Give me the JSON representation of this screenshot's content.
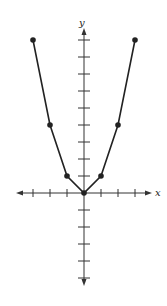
{
  "chart_data": {
    "type": "line",
    "title": "",
    "xlabel": "x",
    "ylabel": "y",
    "x": [
      -3,
      -2,
      -1,
      0,
      1,
      2,
      3
    ],
    "series": [
      {
        "name": "y = x^2",
        "values": [
          9,
          4,
          1,
          0,
          1,
          4,
          9
        ]
      }
    ],
    "xlim": [
      -4,
      4
    ],
    "ylim": [
      -5,
      9
    ],
    "x_ticks": [
      -3,
      -2,
      -1,
      1,
      2,
      3
    ],
    "y_ticks": [
      -5,
      -4,
      -3,
      -2,
      -1,
      1,
      2,
      3,
      4,
      5,
      6,
      7,
      8,
      9
    ],
    "grid": false,
    "markers": true
  },
  "labels": {
    "x_axis": "x",
    "y_axis": "y"
  },
  "colors": {
    "line": "#222222",
    "axes": "#333333",
    "background": "#ffffff"
  }
}
